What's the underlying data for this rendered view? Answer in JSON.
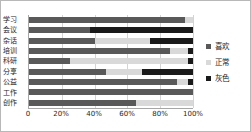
{
  "chart_data": {
    "type": "bar",
    "orientation": "horizontal",
    "stacked": true,
    "stack_mode": "100%",
    "title": "",
    "xlabel": "",
    "ylabel": "",
    "xlim": [
      0,
      100
    ],
    "xticks": [
      0,
      20,
      40,
      60,
      80,
      100
    ],
    "xtick_labels": [
      "0",
      "20%",
      "40%",
      "60%",
      "80%",
      "100%"
    ],
    "grid": true,
    "grid_axis": "x",
    "legend_position": "right",
    "categories": [
      "学习",
      "会议",
      "杂话",
      "培训",
      "科研",
      "分享",
      "公益",
      "工作",
      "创作"
    ],
    "series": [
      {
        "name": "喜欢",
        "color": "#595959",
        "values": [
          95,
          37,
          40,
          86,
          25,
          47,
          90,
          100,
          65
        ]
      },
      {
        "name": "正常",
        "color": "#d9d9d9",
        "values": [
          5,
          0,
          34,
          11,
          72,
          22,
          7,
          0,
          35
        ]
      },
      {
        "name": "灰色",
        "color": "#1a1a1a",
        "values": [
          0,
          63,
          26,
          3,
          3,
          31,
          3,
          0,
          0
        ]
      }
    ]
  },
  "legend": {
    "items": [
      {
        "label": "喜欢",
        "color": "#595959"
      },
      {
        "label": "正常",
        "color": "#d9d9d9"
      },
      {
        "label": "灰色",
        "color": "#1a1a1a"
      }
    ]
  }
}
